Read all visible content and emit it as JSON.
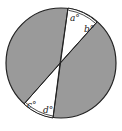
{
  "diagram": {
    "colors": {
      "shaded": "#9a9a9a",
      "outline": "#222222",
      "background": "#ffffff"
    },
    "labels": {
      "a": "a°",
      "b": "b°",
      "c": "c°",
      "d": "d°"
    }
  }
}
